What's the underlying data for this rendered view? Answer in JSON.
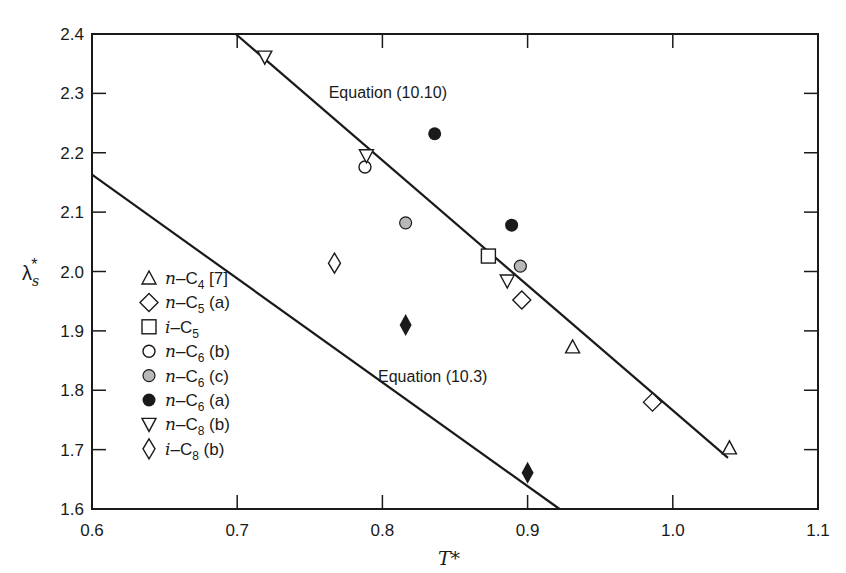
{
  "chart_data": {
    "type": "scatter",
    "title": "",
    "xlabel": "T*",
    "ylabel": "λs*",
    "xlim": [
      0.6,
      1.1
    ],
    "ylim": [
      1.6,
      2.4
    ],
    "grid": false,
    "legend_position": "lower-left",
    "x_ticks": [
      "0.6",
      "0.7",
      "0.8",
      "0.9",
      "1.0",
      "1.1"
    ],
    "y_ticks": [
      "1.6",
      "1.7",
      "1.8",
      "1.9",
      "2.0",
      "2.1",
      "2.2",
      "2.3",
      "2.4"
    ],
    "series": [
      {
        "name": "n-C4 [7]",
        "marker": "triangle-open",
        "points": [
          [
            0.931,
            1.873
          ],
          [
            1.039,
            1.703
          ]
        ]
      },
      {
        "name": "n-C5 (a)",
        "marker": "diamond-open",
        "points": [
          [
            0.896,
            1.952
          ],
          [
            0.986,
            1.78
          ]
        ]
      },
      {
        "name": "i-C5",
        "marker": "square-open",
        "points": [
          [
            0.873,
            2.026
          ]
        ]
      },
      {
        "name": "n-C6 (b)",
        "marker": "circle-open",
        "points": [
          [
            0.788,
            2.176
          ]
        ]
      },
      {
        "name": "n-C6 (c)",
        "marker": "circle-dotted",
        "points": [
          [
            0.816,
            2.082
          ],
          [
            0.895,
            2.009
          ]
        ]
      },
      {
        "name": "n-C6 (a)",
        "marker": "circle-filled",
        "points": [
          [
            0.836,
            2.232
          ],
          [
            0.889,
            2.078
          ]
        ]
      },
      {
        "name": "n-C8 (b)",
        "marker": "triangle-down-open",
        "points": [
          [
            0.719,
            2.361
          ],
          [
            0.789,
            2.195
          ],
          [
            0.886,
            1.984
          ]
        ]
      },
      {
        "name": "i-C8 (b)",
        "marker": "narrow-diamond-open",
        "points": [
          [
            0.767,
            2.014
          ]
        ]
      },
      {
        "name": "unlabeled (filled narrow diamond)",
        "marker": "narrow-diamond-filled",
        "points": [
          [
            0.816,
            1.91
          ],
          [
            0.9,
            1.661
          ]
        ]
      }
    ],
    "lines": [
      {
        "name": "Equation (10.10)",
        "from": [
          0.699,
          2.4
        ],
        "to": [
          1.038,
          1.686
        ]
      },
      {
        "name": "Equation (10.3)",
        "from": [
          0.6,
          2.163
        ],
        "to": [
          0.922,
          1.6
        ]
      }
    ],
    "annotations": [
      {
        "text": "Equation (10.10)",
        "x": 0.763,
        "y": 2.292
      },
      {
        "text": "Equation (10.3)",
        "x": 0.797,
        "y": 1.814
      }
    ]
  },
  "legend": [
    {
      "prefix": "n",
      "base": "C",
      "sub": "4",
      "suffix": " [7]"
    },
    {
      "prefix": "n",
      "base": "C",
      "sub": "5",
      "suffix": " (a)"
    },
    {
      "prefix": "i",
      "base": "C",
      "sub": "5",
      "suffix": ""
    },
    {
      "prefix": "n",
      "base": "C",
      "sub": "6",
      "suffix": " (b)"
    },
    {
      "prefix": "n",
      "base": "C",
      "sub": "6",
      "suffix": " (c)"
    },
    {
      "prefix": "n",
      "base": "C",
      "sub": "6",
      "suffix": " (a)"
    },
    {
      "prefix": "n",
      "base": "C",
      "sub": "8",
      "suffix": " (b)"
    },
    {
      "prefix": "i",
      "base": "C",
      "sub": "8",
      "suffix": " (b)"
    }
  ],
  "axis": {
    "x_label": "T*",
    "y_label_main": "λ",
    "y_label_sub": "s",
    "y_label_sup": "*"
  },
  "colors": {
    "ink": "#1a1a1a",
    "background": "#ffffff",
    "dotted_fill": "#b8b8b8"
  }
}
